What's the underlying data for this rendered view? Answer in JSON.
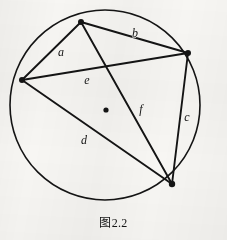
{
  "figure": {
    "caption": "图2.2",
    "caption_x": 0,
    "caption_y": 213,
    "background_color": "#f7f6f3",
    "ink_color": "#141414",
    "width": 227,
    "height": 240
  },
  "geometry": {
    "circle": {
      "name": "circumscribed-circle",
      "cx": 105,
      "cy": 105,
      "r": 95,
      "stroke_width": 1.6
    },
    "center_dot": {
      "name": "circle-center-point",
      "cx": 106,
      "cy": 110,
      "r": 2.6
    },
    "vertices": [
      {
        "id": "A",
        "label": "top-vertex",
        "x": 81,
        "y": 22,
        "r": 3.0
      },
      {
        "id": "B",
        "label": "right-vertex",
        "x": 188,
        "y": 53,
        "r": 3.0
      },
      {
        "id": "C",
        "label": "bottom-right-vertex",
        "x": 172,
        "y": 184,
        "r": 3.2
      },
      {
        "id": "D",
        "label": "left-vertex",
        "x": 22,
        "y": 80,
        "r": 3.0
      }
    ],
    "segments": [
      {
        "id": "a",
        "name": "side-a",
        "from": "D",
        "to": "A",
        "x1": 22,
        "y1": 80,
        "x2": 81,
        "y2": 22,
        "stroke_width": 1.9
      },
      {
        "id": "b",
        "name": "side-b",
        "from": "A",
        "to": "B",
        "x1": 81,
        "y1": 22,
        "x2": 188,
        "y2": 53,
        "stroke_width": 1.9
      },
      {
        "id": "c",
        "name": "side-c",
        "from": "B",
        "to": "C",
        "x1": 188,
        "y1": 53,
        "x2": 172,
        "y2": 184,
        "stroke_width": 1.9
      },
      {
        "id": "d",
        "name": "side-d",
        "from": "C",
        "to": "D",
        "x1": 172,
        "y1": 184,
        "x2": 22,
        "y2": 80,
        "stroke_width": 1.9
      },
      {
        "id": "e",
        "name": "diagonal-e",
        "from": "D",
        "to": "B",
        "x1": 22,
        "y1": 80,
        "x2": 188,
        "y2": 53,
        "stroke_width": 1.9
      },
      {
        "id": "f",
        "name": "diagonal-f",
        "from": "A",
        "to": "C",
        "x1": 81,
        "y1": 22,
        "x2": 172,
        "y2": 184,
        "stroke_width": 1.9
      }
    ],
    "labels": [
      {
        "id": "a",
        "text": "a",
        "x": 61,
        "y": 52
      },
      {
        "id": "b",
        "text": "b",
        "x": 135,
        "y": 33
      },
      {
        "id": "c",
        "text": "c",
        "x": 187,
        "y": 117
      },
      {
        "id": "d",
        "text": "d",
        "x": 84,
        "y": 140
      },
      {
        "id": "e",
        "text": "e",
        "x": 87,
        "y": 80
      },
      {
        "id": "f",
        "text": "f",
        "x": 141,
        "y": 109
      }
    ]
  }
}
